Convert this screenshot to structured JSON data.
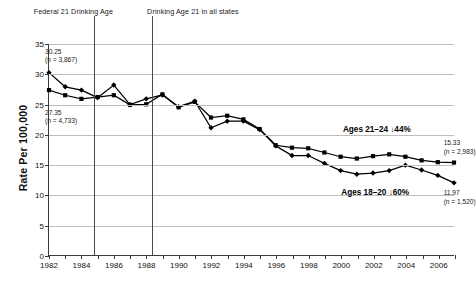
{
  "chart_data": {
    "type": "line",
    "title": "",
    "xlabel": "",
    "ylabel": "Rate Per 100,000",
    "ylim": [
      0,
      35
    ],
    "ytick_step": 5,
    "yticks": [
      "0",
      "5",
      "10",
      "15",
      "20",
      "25",
      "30",
      "35"
    ],
    "xlim": [
      1982,
      2007
    ],
    "xticks": [
      "1982",
      "1984",
      "1986",
      "1988",
      "1990",
      "1992",
      "1994",
      "1996",
      "1998",
      "2000",
      "2002",
      "2004",
      "2006"
    ],
    "xtick_step": 2,
    "grid": "horizontal",
    "legend": "none",
    "x": [
      1982,
      1983,
      1984,
      1985,
      1986,
      1987,
      1988,
      1989,
      1990,
      1991,
      1992,
      1993,
      1994,
      1995,
      1996,
      1997,
      1998,
      1999,
      2000,
      2001,
      2002,
      2003,
      2004,
      2005,
      2006,
      2007
    ],
    "series": [
      {
        "name": "Ages 18-20",
        "marker": "diamond",
        "values": [
          30.25,
          27.9,
          27.35,
          26.1,
          28.2,
          24.95,
          25.9,
          26.55,
          24.6,
          25.5,
          21.1,
          22.2,
          22.2,
          20.8,
          18.1,
          16.5,
          16.5,
          15.2,
          14.0,
          13.4,
          13.6,
          14.0,
          14.9,
          14.1,
          13.2,
          11.97
        ]
      },
      {
        "name": "Ages 21-24",
        "marker": "square",
        "values": [
          27.35,
          26.5,
          25.9,
          26.2,
          26.5,
          24.9,
          25.0,
          26.65,
          24.5,
          25.4,
          22.8,
          23.1,
          22.5,
          20.9,
          18.2,
          17.8,
          17.7,
          17.0,
          16.3,
          16.0,
          16.4,
          16.7,
          16.3,
          15.7,
          15.4,
          15.33
        ]
      }
    ],
    "annotations": {
      "top_line_1": "Federal 21 Drinking Age",
      "top_line_2": "Drinking Age 21 in all states",
      "vline_1_year": 1984.75,
      "vline_2_year": 1988.35,
      "start_label_high": "30.25",
      "start_label_high_n": "(n = 3,867)",
      "start_label_low": "27.35",
      "start_label_low_n": "(n = 4,733)",
      "end_label_high": "15.33",
      "end_label_high_n": "(n = 2,983)",
      "end_label_low": "11.97",
      "end_label_low_n": "(n = 1,520)",
      "series_label_upper": "Ages 21–24 ↓44%",
      "series_label_lower": "Ages 18–20 ↓60%"
    }
  }
}
